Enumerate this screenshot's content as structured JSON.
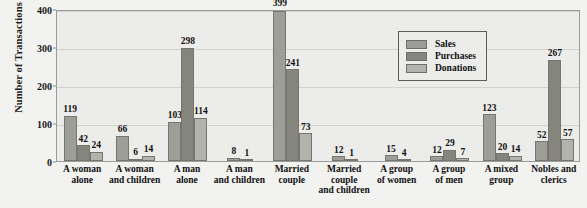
{
  "chart_data": {
    "type": "bar",
    "title": "",
    "xlabel": "",
    "ylabel": "Number of Transactions",
    "ylim": [
      0,
      400
    ],
    "yticks": [
      0,
      100,
      200,
      300,
      400
    ],
    "grid": true,
    "legend_position": "top-right",
    "categories": [
      "A woman alone",
      "A woman and children",
      "A man alone",
      "A man and children",
      "Married couple",
      "Married couple and children",
      "A group of women",
      "A group of men",
      "A mixed group",
      "Nobles and clerics"
    ],
    "category_lines": [
      [
        "A woman",
        "alone"
      ],
      [
        "A woman",
        "and children"
      ],
      [
        "A man",
        "alone"
      ],
      [
        "A man",
        "and children"
      ],
      [
        "Married",
        "couple"
      ],
      [
        "Married",
        "couple",
        "and children"
      ],
      [
        "A group",
        "of women"
      ],
      [
        "A group",
        "of men"
      ],
      [
        "A mixed",
        "group"
      ],
      [
        "Nobles and",
        "clerics"
      ]
    ],
    "series": [
      {
        "name": "Sales",
        "color": "#9e9e98",
        "values": [
          119,
          66,
          103,
          8,
          399,
          12,
          15,
          12,
          123,
          52
        ],
        "labels": [
          "119",
          "66",
          "103",
          "8",
          "399",
          "12",
          "15",
          "12",
          "123",
          "52"
        ]
      },
      {
        "name": "Purchases",
        "color": "#85857e",
        "values": [
          42,
          6,
          298,
          0,
          241,
          0,
          0,
          29,
          20,
          267
        ],
        "labels": [
          "42",
          "6",
          "298",
          "",
          "241",
          "",
          "",
          "29",
          "20",
          "267"
        ]
      },
      {
        "name": "Donations",
        "color": "#b3b3ad",
        "values": [
          24,
          14,
          114,
          1,
          73,
          1,
          4,
          7,
          14,
          57
        ],
        "labels": [
          "24",
          "14",
          "114",
          "1",
          "73",
          "1",
          "4",
          "7",
          "14",
          "57"
        ]
      }
    ]
  },
  "legend": {
    "items": [
      {
        "label": "Sales",
        "swatch": "sales"
      },
      {
        "label": "Purchases",
        "swatch": "purchases"
      },
      {
        "label": "Donations",
        "swatch": "donations"
      }
    ]
  },
  "axis": {
    "y_title": "Number of Transactions",
    "y_tick_labels": [
      "400",
      "300",
      "200",
      "100",
      "0"
    ]
  }
}
